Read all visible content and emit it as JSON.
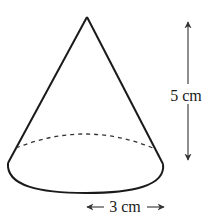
{
  "figure": {
    "shape": "cone",
    "height_label": "5 cm",
    "radius_label": "3 cm",
    "height_value": 5,
    "radius_value": 3,
    "unit": "cm"
  },
  "colors": {
    "stroke": "#1a1a1a",
    "dashed": "#333333",
    "arrow": "#444444",
    "background": "#ffffff"
  }
}
